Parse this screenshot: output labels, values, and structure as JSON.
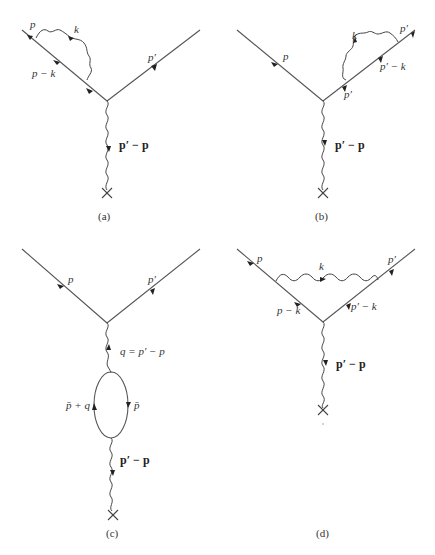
{
  "figure": {
    "panels": [
      {
        "id": "a",
        "caption": "(a)",
        "labels": {
          "incoming": "p",
          "loop_photon": "k",
          "internal": "p − k",
          "outgoing": "p′",
          "external_photon": "p′ − p"
        }
      },
      {
        "id": "b",
        "caption": "(b)",
        "labels": {
          "incoming": "p",
          "loop_photon": "k",
          "outgoing_end": "p′",
          "internal": "p′ − k",
          "outgoing_start": "p′",
          "external_photon": "p′ − p"
        }
      },
      {
        "id": "c",
        "caption": "(c)",
        "labels": {
          "incoming": "p",
          "outgoing": "p′",
          "virtual_photon": "q = p′ − p",
          "loop_left": "p̄ + q",
          "loop_right": "p̄",
          "external_photon": "p′ − p"
        }
      },
      {
        "id": "d",
        "caption": "(d)",
        "labels": {
          "incoming": "p",
          "loop_photon": "k",
          "outgoing": "p′",
          "internal_left": "p − k",
          "internal_right": "p′ − k",
          "external_photon": "p′ − p"
        }
      }
    ],
    "colors": {
      "line": "#555555",
      "arrow": "#222222",
      "background": "#ffffff"
    }
  }
}
